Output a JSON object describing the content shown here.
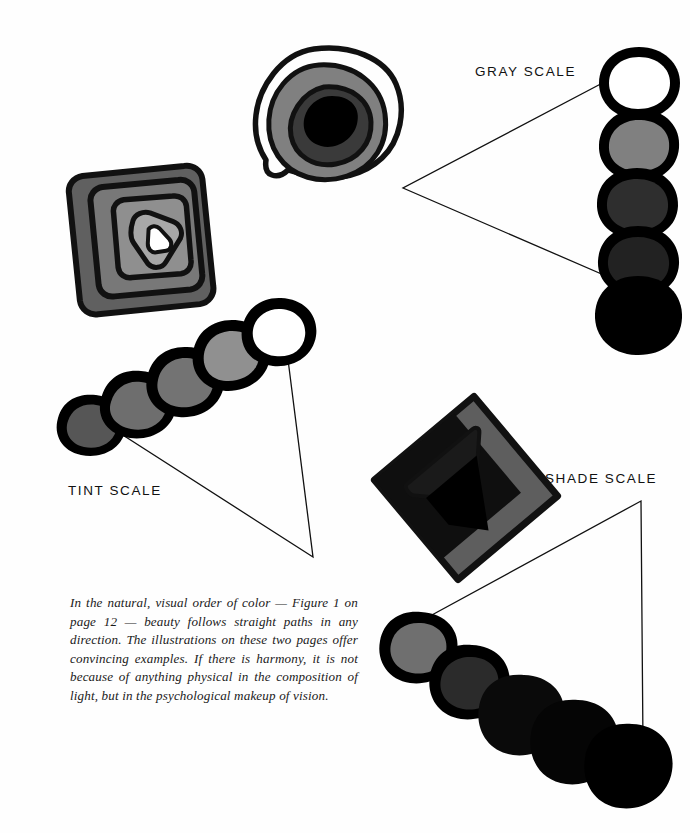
{
  "page": {
    "background_color": "#fefefe",
    "width": 690,
    "height": 833
  },
  "labels": {
    "gray_scale": "GRAY SCALE",
    "tint_scale": "TINT SCALE",
    "shade_scale": "SHADE SCALE"
  },
  "caption": {
    "text": "In the natural, visual order of color — Figure 1 on page 12 — beauty follows straight paths in any direction. The illustrations on these two pages offer convincing examples. If there is harmony, it is not because of anything physical in the composition of light, but in the psychological makeup of vision."
  },
  "palette": {
    "ink": "#111111",
    "white": "#ffffff",
    "light_gray": "#9a9a9a",
    "mid_gray": "#7d7d7d",
    "gray": "#606060",
    "dark_gray": "#4a4a4a",
    "darker_gray": "#333333",
    "near_black": "#1c1c1c",
    "black": "#000000"
  },
  "scales": {
    "gray": {
      "name": "gray-scale-chain",
      "orientation": "vertical",
      "step_count": 5,
      "steps": [
        {
          "index": 1,
          "fill": "#ffffff",
          "name": "white"
        },
        {
          "index": 2,
          "fill": "#808080",
          "name": "light-gray"
        },
        {
          "index": 3,
          "fill": "#2e2e2e",
          "name": "dark-gray"
        },
        {
          "index": 4,
          "fill": "#222222",
          "name": "darker-gray"
        },
        {
          "index": 5,
          "fill": "#000000",
          "name": "black"
        }
      ]
    },
    "tint": {
      "name": "tint-scale-chain",
      "orientation": "diagonal-up-right",
      "step_count": 5,
      "steps": [
        {
          "index": 1,
          "fill": "#565656",
          "name": "dark-gray"
        },
        {
          "index": 2,
          "fill": "#6e6e6e",
          "name": "gray"
        },
        {
          "index": 3,
          "fill": "#737373",
          "name": "mid-gray"
        },
        {
          "index": 4,
          "fill": "#909090",
          "name": "light-gray"
        },
        {
          "index": 5,
          "fill": "#ffffff",
          "name": "white"
        }
      ]
    },
    "shade": {
      "name": "shade-scale-chain",
      "orientation": "diagonal-down-right",
      "step_count": 5,
      "steps": [
        {
          "index": 1,
          "fill": "#6f6f6f",
          "name": "gray"
        },
        {
          "index": 2,
          "fill": "#2b2b2b",
          "name": "dark-gray"
        },
        {
          "index": 3,
          "fill": "#0a0a0a",
          "name": "near-black"
        },
        {
          "index": 4,
          "fill": "#050505",
          "name": "black"
        },
        {
          "index": 5,
          "fill": "#000000",
          "name": "black"
        }
      ]
    }
  },
  "artworks": {
    "gray": {
      "name": "gray-scale-artwork",
      "description": "Concentric nested organic blobs, outline ring plus mid gray, dark gray and black cores"
    },
    "tint": {
      "name": "tint-scale-artwork",
      "description": "Nested rotated rounded squares growing lighter toward a white triangular center"
    },
    "shade": {
      "name": "shade-scale-artwork",
      "description": "Rotated gray diamond containing nested near-black angular shapes"
    }
  }
}
